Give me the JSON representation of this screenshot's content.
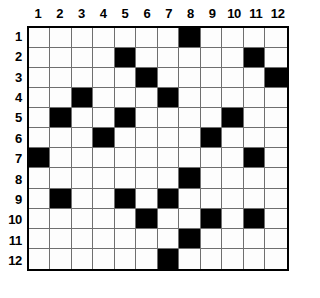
{
  "puzzle": {
    "type": "grid-puzzle",
    "rows": 12,
    "cols": 12,
    "column_headers": [
      "1",
      "2",
      "3",
      "4",
      "5",
      "6",
      "7",
      "8",
      "9",
      "10",
      "11",
      "12"
    ],
    "row_headers": [
      "1",
      "2",
      "3",
      "4",
      "5",
      "6",
      "7",
      "8",
      "9",
      "10",
      "11",
      "12"
    ],
    "colors": {
      "filled": "#000000",
      "empty": "#fdfdfd",
      "gridline": "#6f6f6f",
      "border": "#000000",
      "label": "#000000",
      "background": "#ffffff"
    },
    "filled_cells_by_row": [
      [
        8
      ],
      [
        5,
        11
      ],
      [
        6,
        12
      ],
      [
        3,
        7
      ],
      [
        2,
        5,
        10
      ],
      [
        4,
        9
      ],
      [
        1,
        11
      ],
      [
        8
      ],
      [
        2,
        5,
        7
      ],
      [
        6,
        9,
        11
      ],
      [
        8
      ],
      [
        7
      ]
    ],
    "grid": [
      [
        0,
        0,
        0,
        0,
        0,
        0,
        0,
        1,
        0,
        0,
        0,
        0
      ],
      [
        0,
        0,
        0,
        0,
        1,
        0,
        0,
        0,
        0,
        0,
        1,
        0
      ],
      [
        0,
        0,
        0,
        0,
        0,
        1,
        0,
        0,
        0,
        0,
        0,
        1
      ],
      [
        0,
        0,
        1,
        0,
        0,
        0,
        1,
        0,
        0,
        0,
        0,
        0
      ],
      [
        0,
        1,
        0,
        0,
        1,
        0,
        0,
        0,
        0,
        1,
        0,
        0
      ],
      [
        0,
        0,
        0,
        1,
        0,
        0,
        0,
        0,
        1,
        0,
        0,
        0
      ],
      [
        1,
        0,
        0,
        0,
        0,
        0,
        0,
        0,
        0,
        0,
        1,
        0
      ],
      [
        0,
        0,
        0,
        0,
        0,
        0,
        0,
        1,
        0,
        0,
        0,
        0
      ],
      [
        0,
        1,
        0,
        0,
        1,
        0,
        1,
        0,
        0,
        0,
        0,
        0
      ],
      [
        0,
        0,
        0,
        0,
        0,
        1,
        0,
        0,
        1,
        0,
        1,
        0
      ],
      [
        0,
        0,
        0,
        0,
        0,
        0,
        0,
        1,
        0,
        0,
        0,
        0
      ],
      [
        0,
        0,
        0,
        0,
        0,
        0,
        1,
        0,
        0,
        0,
        0,
        0
      ]
    ],
    "total_filled": 22
  }
}
